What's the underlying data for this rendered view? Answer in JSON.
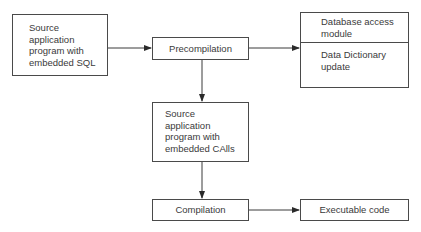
{
  "diagram": {
    "type": "flowchart",
    "nodes": [
      {
        "id": "source_sql",
        "label": "Source application program with embedded SQL",
        "lines": [
          "Source",
          "application",
          "program with",
          "embedded SQL"
        ]
      },
      {
        "id": "precompilation",
        "label": "Precompilation"
      },
      {
        "id": "outputs",
        "sections": [
          {
            "id": "db_access",
            "lines": [
              "Database access",
              "module"
            ]
          },
          {
            "id": "dd_update",
            "lines": [
              "Data Dictionary",
              "update"
            ]
          }
        ]
      },
      {
        "id": "source_calls",
        "label": "Source application program with embedded CAlls",
        "lines": [
          "Source",
          "application",
          "program with",
          "embedded CAlls"
        ]
      },
      {
        "id": "compilation",
        "label": "Compilation"
      },
      {
        "id": "executable",
        "label": "Executable code"
      }
    ],
    "edges": [
      {
        "from": "source_sql",
        "to": "precompilation"
      },
      {
        "from": "precompilation",
        "to": "outputs"
      },
      {
        "from": "precompilation",
        "to": "source_calls"
      },
      {
        "from": "source_calls",
        "to": "compilation"
      },
      {
        "from": "compilation",
        "to": "executable"
      }
    ],
    "colors": {
      "line": "#3a3a3a",
      "background": "#ffffff"
    }
  }
}
